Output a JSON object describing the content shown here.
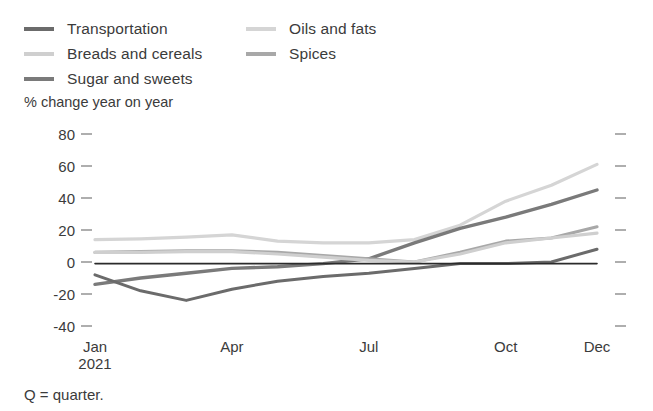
{
  "legend": {
    "columns": [
      {
        "items": [
          {
            "label": "Transportation",
            "color": "#6b6b6b",
            "swatch_icon": "line-swatch-icon"
          },
          {
            "label": "Breads and cereals",
            "color": "#cfcfcf",
            "swatch_icon": "line-swatch-icon"
          },
          {
            "label": "Sugar and sweets",
            "color": "#7a7a7a",
            "swatch_icon": "line-swatch-icon"
          }
        ]
      },
      {
        "items": [
          {
            "label": "Oils and fats",
            "color": "#d5d5d5",
            "swatch_icon": "line-swatch-icon"
          },
          {
            "label": "Spices",
            "color": "#a8a8a8",
            "swatch_icon": "line-swatch-icon"
          }
        ]
      }
    ]
  },
  "axis_title": "% change year on year",
  "footnote": "Q = quarter.",
  "chart_data": {
    "type": "line",
    "title": "",
    "subtitle": "",
    "xlabel": "",
    "ylabel": "% change year on year",
    "ylim": [
      -40,
      80
    ],
    "yticks": [
      80,
      60,
      40,
      20,
      0,
      -20,
      -40
    ],
    "ytick_labels": [
      "80",
      "60",
      "40",
      "20",
      "0",
      "-20",
      "-40"
    ],
    "grid": false,
    "zero_line": true,
    "legend_position": "top-left",
    "x": [
      "Jan",
      "Feb",
      "Mar",
      "Apr",
      "May",
      "Jun",
      "Jul",
      "Aug",
      "Sep",
      "Oct",
      "Nov",
      "Dec"
    ],
    "xtick_positions": [
      "Jan",
      "Apr",
      "Jul",
      "Oct",
      "Dec"
    ],
    "xtick_labels": [
      {
        "main": "Jan",
        "sub": "2021"
      },
      {
        "main": "Apr",
        "sub": ""
      },
      {
        "main": "Jul",
        "sub": ""
      },
      {
        "main": "Oct",
        "sub": ""
      },
      {
        "main": "Dec",
        "sub": ""
      }
    ],
    "series": [
      {
        "name": "Oils and fats",
        "color": "#d5d5d5",
        "width": 3.2,
        "values": [
          14,
          14.5,
          15.5,
          17,
          13,
          12,
          12,
          14,
          23,
          38,
          48,
          61
        ]
      },
      {
        "name": "Sugar and sweets",
        "color": "#7a7a7a",
        "width": 3.4,
        "values": [
          -14,
          -10,
          -7,
          -4,
          -3,
          -1,
          2,
          12,
          21,
          28,
          36,
          45
        ]
      },
      {
        "name": "Spices",
        "color": "#a8a8a8",
        "width": 3.2,
        "values": [
          6,
          6.5,
          7,
          7,
          6,
          4,
          2,
          0,
          6,
          13,
          15,
          22
        ]
      },
      {
        "name": "Breads and cereals",
        "color": "#cfcfcf",
        "width": 3.2,
        "values": [
          6,
          6,
          6.5,
          6.5,
          5,
          3,
          1,
          0,
          5,
          12,
          15,
          18
        ]
      },
      {
        "name": "Transportation",
        "color": "#6b6b6b",
        "width": 3.0,
        "values": [
          -8,
          -18,
          -24,
          -17,
          -12,
          -9,
          -7,
          -4,
          -1,
          -1,
          0,
          8
        ]
      },
      {
        "name": "zero-reference",
        "color": "#2b2b2b",
        "width": 1.6,
        "values": [
          -1,
          -1,
          -1,
          -1,
          -1,
          -1,
          -1,
          -1,
          -1,
          -1,
          -1,
          -1
        ]
      }
    ]
  }
}
